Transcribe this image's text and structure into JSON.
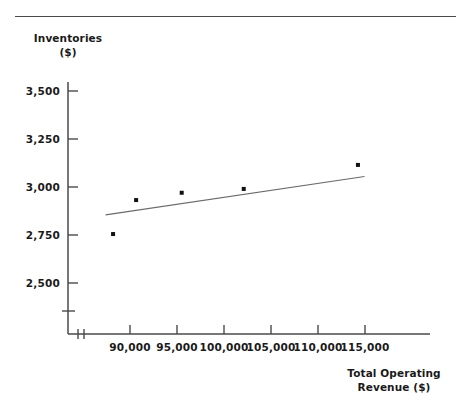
{
  "chart_data": {
    "type": "scatter",
    "title": "",
    "xlabel": "Total Operating Revenue ($)",
    "ylabel": "Inventories ($)",
    "ylabel_line1": "Inventories",
    "ylabel_line2": "($)",
    "xlabel_line1": "Total Operating",
    "xlabel_line2": "Revenue ($)",
    "x_ticks": [
      "90,000",
      "95,000",
      "100,000",
      "105,000",
      "110,000",
      "115,000"
    ],
    "x_tick_values": [
      90000,
      95000,
      100000,
      105000,
      110000,
      115000
    ],
    "y_ticks": [
      "2,500",
      "2,750",
      "3,000",
      "3,250",
      "3,500"
    ],
    "y_tick_values": [
      2500,
      2750,
      3000,
      3250,
      3500
    ],
    "xlim": [
      86500,
      117500
    ],
    "ylim": [
      2400,
      3600
    ],
    "grid": false,
    "legend": null,
    "axis_break_x": true,
    "axis_break_y": true,
    "points": [
      {
        "x": 88200,
        "y": 2755
      },
      {
        "x": 90650,
        "y": 2932
      },
      {
        "x": 95500,
        "y": 2970
      },
      {
        "x": 102100,
        "y": 2990
      },
      {
        "x": 114250,
        "y": 3115
      }
    ],
    "series": [
      {
        "name": "Inventories vs Total Operating Revenue",
        "x": [
          88200,
          90650,
          95500,
          102100,
          114250
        ],
        "values": [
          2755,
          2932,
          2970,
          2990,
          3115
        ]
      }
    ],
    "trendline": {
      "type": "linear",
      "x_start": 87400,
      "y_start": 2855,
      "x_end": 114950,
      "y_end": 3055
    },
    "colors": {
      "axis": "#4a4a4a",
      "marker": "#111111",
      "trendline": "#6a6a6a",
      "text": "#1a1a1a",
      "background": "#ffffff"
    }
  }
}
